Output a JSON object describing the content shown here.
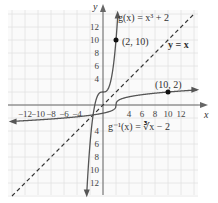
{
  "chart_data": {
    "type": "line",
    "title": "",
    "xlabel": "x",
    "ylabel": "y",
    "xlim": [
      -14,
      14
    ],
    "ylim": [
      -14,
      14
    ],
    "grid": true,
    "x_ticks": [
      -12,
      -10,
      -8,
      -6,
      -4,
      4,
      6,
      8,
      10,
      12
    ],
    "y_ticks": [
      12,
      10,
      8,
      6,
      4,
      -4,
      -6,
      -8,
      -10,
      12
    ],
    "x_tick_labels": [
      "−12",
      "−10",
      "−8",
      "−6",
      "−4",
      "4",
      "6",
      "8",
      "10",
      "12"
    ],
    "y_tick_labels_pos": [
      "12",
      "10",
      "8",
      "6",
      "4"
    ],
    "y_tick_labels_neg": [
      "4",
      "6",
      "8",
      "10",
      "12"
    ],
    "series": [
      {
        "name": "g(x) = x³ + 2",
        "style": "solid",
        "color": "#555555"
      },
      {
        "name": "g⁻¹(x) = ∛(x − 2)",
        "style": "solid",
        "color": "#555555"
      },
      {
        "name": "y = x",
        "style": "dashed",
        "color": "#333333"
      }
    ],
    "points": [
      {
        "label": "(2, 10)",
        "x": 2,
        "y": 10
      },
      {
        "label": "(10, 2)",
        "x": 10,
        "y": 2
      }
    ],
    "annotations": {
      "g": "g(x) = x³ + 2",
      "ginv": "g⁻¹(x) = ∛x − 2",
      "identity": "y = x"
    }
  }
}
